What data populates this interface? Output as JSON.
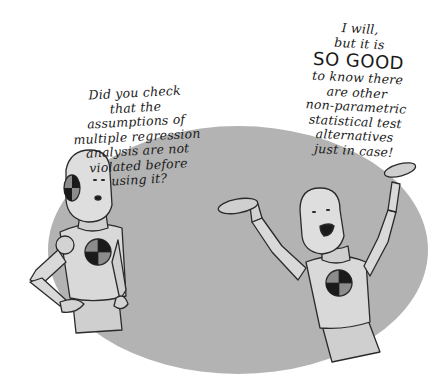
{
  "illustration": {
    "background_color": "#ffffff",
    "ellipse_color": "#b3b3b3",
    "dummy_body_color": "#d9d9d9",
    "outline_color": "#2a2a2a",
    "target_dark": "#1a1a1a",
    "target_light": "#8c8c8c"
  },
  "left_speech": {
    "lines": [
      "Did you check",
      "that the",
      "assumptions of",
      "multiple regression",
      "analysis are not",
      "violated before",
      "using it?"
    ]
  },
  "right_speech": {
    "lines": [
      "I will,",
      "but it is",
      "SO GOOD",
      "to know there",
      "are other",
      "non-parametric",
      "statistical test",
      "alternatives",
      "just in case!"
    ]
  },
  "characters": [
    {
      "name": "crash-test-dummy-left",
      "pose": "hand on hip, asking"
    },
    {
      "name": "crash-test-dummy-right",
      "pose": "arms raised, cheering"
    }
  ]
}
